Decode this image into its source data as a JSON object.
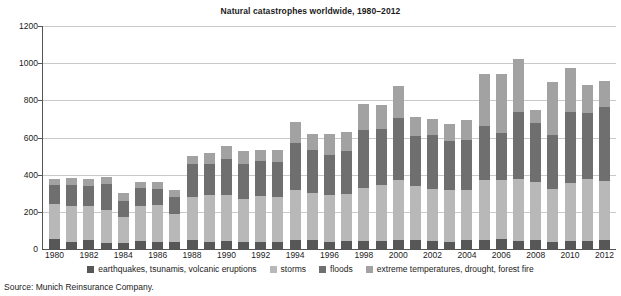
{
  "chart_data": {
    "type": "bar",
    "stacked": true,
    "title": "Natural catastrophes worldwide, 1980–2012",
    "xlabel": "",
    "ylabel": "",
    "ylim": [
      0,
      1200
    ],
    "ytick_step": 200,
    "yticks": [
      0,
      200,
      400,
      600,
      800,
      1000,
      1200
    ],
    "ytick_labels": [
      "0",
      "200",
      "400",
      "600",
      "800",
      "1000",
      "1200"
    ],
    "grid": true,
    "grid_axis": "y",
    "legend_position": "bottom",
    "categories": [
      "1980",
      "1981",
      "1982",
      "1983",
      "1984",
      "1985",
      "1986",
      "1987",
      "1988",
      "1989",
      "1990",
      "1991",
      "1992",
      "1993",
      "1994",
      "1995",
      "1996",
      "1997",
      "1998",
      "1999",
      "2000",
      "2001",
      "2002",
      "2003",
      "2004",
      "2005",
      "2006",
      "2007",
      "2008",
      "2009",
      "2010",
      "2011",
      "2012"
    ],
    "xtick_labels": [
      "1980",
      "1982",
      "1984",
      "1986",
      "1988",
      "1990",
      "1992",
      "1994",
      "1996",
      "1998",
      "2000",
      "2002",
      "2004",
      "2006",
      "2008",
      "2010",
      "2012"
    ],
    "series": [
      {
        "name": "earthquakes, tsunamis, volcanic eruptions",
        "color": "#575757",
        "values": [
          55,
          40,
          50,
          35,
          35,
          45,
          40,
          40,
          50,
          40,
          45,
          40,
          40,
          40,
          50,
          50,
          40,
          45,
          45,
          45,
          50,
          50,
          45,
          40,
          50,
          50,
          55,
          45,
          50,
          40,
          45,
          45,
          50
        ]
      },
      {
        "name": "storms",
        "color": "#b8b8b8",
        "values": [
          185,
          190,
          180,
          175,
          135,
          185,
          195,
          150,
          230,
          250,
          245,
          230,
          245,
          240,
          265,
          250,
          250,
          250,
          285,
          300,
          320,
          290,
          280,
          280,
          265,
          320,
          315,
          330,
          310,
          285,
          310,
          330,
          315
        ]
      },
      {
        "name": "floods",
        "color": "#6f6f6f",
        "values": [
          105,
          115,
          110,
          140,
          90,
          100,
          90,
          90,
          175,
          170,
          195,
          190,
          190,
          190,
          255,
          235,
          215,
          230,
          310,
          300,
          335,
          270,
          290,
          260,
          270,
          290,
          255,
          360,
          320,
          290,
          380,
          355,
          400
        ]
      },
      {
        "name": "extreme temperatures, drought, forest fire",
        "color": "#a2a2a2",
        "values": [
          30,
          35,
          35,
          40,
          40,
          30,
          35,
          40,
          45,
          55,
          70,
          65,
          60,
          65,
          115,
          85,
          115,
          105,
          140,
          130,
          175,
          100,
          85,
          95,
          110,
          280,
          315,
          290,
          70,
          285,
          240,
          155,
          140
        ]
      }
    ],
    "totals": [
      375,
      380,
      375,
      390,
      300,
      360,
      360,
      320,
      500,
      515,
      555,
      525,
      535,
      535,
      685,
      620,
      620,
      630,
      780,
      775,
      880,
      710,
      700,
      675,
      695,
      940,
      940,
      1025,
      750,
      900,
      975,
      885,
      905
    ]
  },
  "legend": {
    "items": [
      {
        "label": "earthquakes, tsunamis, volcanic eruptions",
        "color": "#575757"
      },
      {
        "label": "storms",
        "color": "#b8b8b8"
      },
      {
        "label": "floods",
        "color": "#6f6f6f"
      },
      {
        "label": "extreme temperatures, drought, forest fire",
        "color": "#a2a2a2"
      }
    ]
  },
  "source": {
    "text": "Source: Munich Reinsurance Company."
  }
}
